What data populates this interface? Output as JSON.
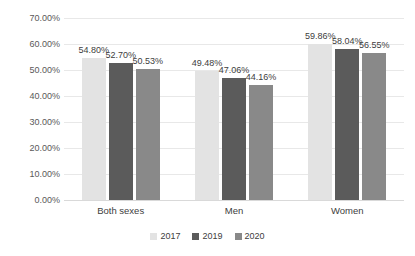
{
  "chart_data": {
    "type": "bar",
    "title": "",
    "subtitle": "",
    "xlabel": "",
    "ylabel": "",
    "ylim": [
      0,
      70
    ],
    "ytick_step": 10,
    "ytick_labels": [
      "0.00%",
      "10.00%",
      "20.00%",
      "30.00%",
      "40.00%",
      "50.00%",
      "60.00%",
      "70.00%"
    ],
    "ytick_values": [
      0,
      10,
      20,
      30,
      40,
      50,
      60,
      70
    ],
    "grid": true,
    "grid_axis": "y",
    "legend_position": "bottom",
    "value_labels": true,
    "value_label_format": "percent-2dp",
    "categories": [
      "Both sexes",
      "Men",
      "Women"
    ],
    "series": [
      {
        "name": "2017",
        "color": "#e3e3e3",
        "values": [
          54.8,
          49.48,
          59.86
        ],
        "labels": [
          "54.80%",
          "49.48%",
          "59.86%"
        ]
      },
      {
        "name": "2019",
        "color": "#5b5b5b",
        "values": [
          52.7,
          47.06,
          58.04
        ],
        "labels": [
          "52.70%",
          "47.06%",
          "58.04%"
        ]
      },
      {
        "name": "2020",
        "color": "#898989",
        "values": [
          50.53,
          44.16,
          56.55
        ],
        "labels": [
          "50.53%",
          "44.16%",
          "56.55%"
        ]
      }
    ]
  },
  "colors": {
    "background": "#ffffff",
    "gridline": "#e8e8e8",
    "axis": "#d9d9d9",
    "text": "#404040",
    "tick_text": "#595959"
  }
}
